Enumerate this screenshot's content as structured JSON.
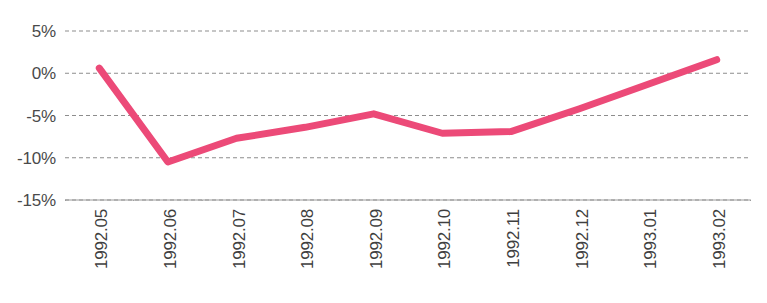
{
  "chart_data": {
    "type": "line",
    "title": "",
    "subtitle": "",
    "xlabel": "",
    "ylabel": "",
    "categories": [
      "1992.05",
      "1992.06",
      "1992.07",
      "1992.08",
      "1992.09",
      "1992.10",
      "1992.11",
      "1992.12",
      "1993.01",
      "1993.02"
    ],
    "series": [
      {
        "name": "series-1",
        "color": "#ec4a78",
        "values": [
          0.6,
          -10.5,
          -7.7,
          -6.4,
          -4.8,
          -7.1,
          -6.9,
          -4.2,
          -1.3,
          1.6
        ]
      }
    ],
    "ylim": [
      -15,
      5
    ],
    "yticks": [
      5,
      0,
      -5,
      -10,
      -15
    ],
    "ytick_labels": [
      "5%",
      "0%",
      "-5%",
      "-10%",
      "-15%"
    ],
    "grid": true,
    "grid_style": "dashed-horizontal",
    "grid_color": "#8d8d8d",
    "legend": "none",
    "axis_color": "#9a9a9a",
    "line_width": 7
  },
  "axes": {
    "y_labels": [
      "5%",
      "0%",
      "-5%",
      "-10%",
      "-15%"
    ],
    "x_labels": [
      "1992.05",
      "1992.06",
      "1992.07",
      "1992.08",
      "1992.09",
      "1992.10",
      "1992.11",
      "1992.12",
      "1993.01",
      "1993.02"
    ]
  },
  "colors": {
    "line": "#ec4a78",
    "grid": "#8d8d8d",
    "axis": "#9a9a9a",
    "text": "#3f3f3f",
    "background": "#ffffff"
  }
}
